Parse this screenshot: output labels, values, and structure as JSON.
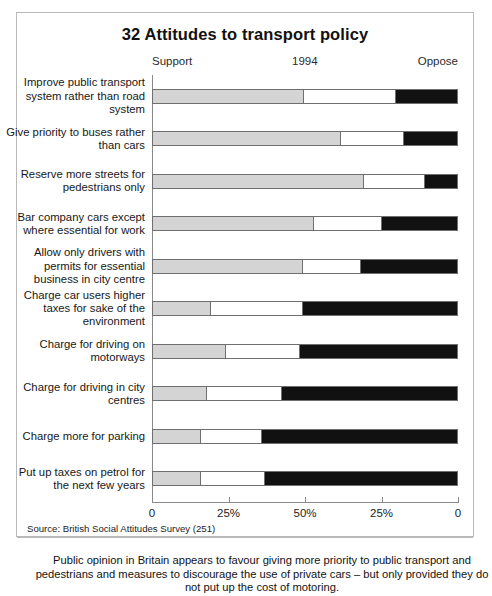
{
  "chart_data": {
    "type": "bar",
    "title": "32 Attitudes to transport policy",
    "subtitle": "1994",
    "orientation": "horizontal",
    "stacked": true,
    "xlabel": "",
    "ylabel": "",
    "xlim": [
      0,
      100
    ],
    "grid": false,
    "legend_position": "top",
    "left_axis_label": "Support",
    "right_axis_label": "Oppose",
    "axis_ticks": [
      {
        "label": "0",
        "pos_pct": 0
      },
      {
        "label": "25%",
        "pos_pct": 25
      },
      {
        "label": "50%",
        "pos_pct": 50
      },
      {
        "label": "25%",
        "pos_pct": 75
      },
      {
        "label": "0",
        "pos_pct": 100
      }
    ],
    "series": [
      {
        "name": "Support",
        "color": "#d4d4d4"
      },
      {
        "name": "Neither / Don't know",
        "color": "#ffffff"
      },
      {
        "name": "Oppose",
        "color": "#111111"
      }
    ],
    "categories": [
      "Improve public transport system rather than road system",
      "Give priority to buses rather than cars",
      "Reserve more streets for pedestrians only",
      "Bar company cars except where essential for work",
      "Allow only drivers with permits for essential business in city centre",
      "Charge car users higher taxes for sake of the environment",
      "Charge for driving on motorways",
      "Charge for driving in city centres",
      "Charge more for parking",
      "Put up taxes on petrol for the next few years"
    ],
    "rows": [
      {
        "label": "Improve public transport system rather than road system",
        "support": 49.5,
        "neutral": 30.5,
        "oppose": 20.0
      },
      {
        "label": "Give priority to buses rather than cars",
        "support": 61.5,
        "neutral": 21.2,
        "oppose": 17.3
      },
      {
        "label": "Reserve more streets for pedestrians only",
        "support": 69.0,
        "neutral": 20.5,
        "oppose": 10.5
      },
      {
        "label": "Bar company cars except where essential for work",
        "support": 52.5,
        "neutral": 22.9,
        "oppose": 24.6
      },
      {
        "label": "Allow only drivers with permits for essential business in city centre",
        "support": 49.0,
        "neutral": 19.3,
        "oppose": 31.7
      },
      {
        "label": "Charge car users higher taxes for sake of the environment",
        "support": 18.7,
        "neutral": 30.6,
        "oppose": 50.7
      },
      {
        "label": "Charge for driving on motorways",
        "support": 23.8,
        "neutral": 24.5,
        "oppose": 51.7
      },
      {
        "label": "Charge for driving in city centres",
        "support": 17.4,
        "neutral": 25.1,
        "oppose": 57.5
      },
      {
        "label": "Charge more for parking",
        "support": 15.3,
        "neutral": 20.7,
        "oppose": 64.0
      },
      {
        "label": "Put up taxes on petrol for the next few years",
        "support": 15.3,
        "neutral": 21.4,
        "oppose": 63.3
      }
    ]
  },
  "source": "Source: British Social Attitudes Survey (251)",
  "caption": "Public opinion in Britain appears to favour giving more priority to public transport and pedestrians and measures to discourage the use of private cars – but only provided they do not put up the cost of motoring."
}
